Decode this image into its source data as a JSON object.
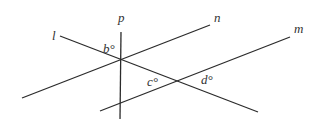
{
  "diagram": {
    "type": "geometry-intersecting-lines",
    "stroke_color": "#2b2b2b",
    "label_color": "#333333",
    "lines": [
      {
        "name": "l",
        "label": "l",
        "x1": 60,
        "y1": 36,
        "x2": 258,
        "y2": 112,
        "label_x": 52,
        "label_y": 40
      },
      {
        "name": "n",
        "label": "n",
        "x1": 22,
        "y1": 98,
        "x2": 210,
        "y2": 25,
        "label_x": 214,
        "label_y": 22
      },
      {
        "name": "m",
        "label": "m",
        "x1": 100,
        "y1": 111,
        "x2": 290,
        "y2": 37,
        "label_x": 294,
        "label_y": 33
      },
      {
        "name": "p",
        "label": "p",
        "x1": 121,
        "y1": 32,
        "x2": 120,
        "y2": 119,
        "label_x": 118,
        "label_y": 22
      }
    ],
    "angles": [
      {
        "name": "b",
        "label": "b°",
        "x": 103,
        "y": 53
      },
      {
        "name": "c",
        "label": "c°",
        "x": 147,
        "y": 86
      },
      {
        "name": "d",
        "label": "d°",
        "x": 201,
        "y": 84
      }
    ],
    "intersection_points": [
      {
        "lines": [
          "l",
          "n",
          "p"
        ],
        "x": 121,
        "y": 60
      },
      {
        "lines": [
          "l",
          "m"
        ],
        "x": 178,
        "y": 81
      }
    ]
  }
}
